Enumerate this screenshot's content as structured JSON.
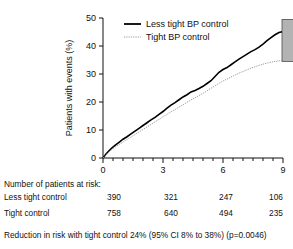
{
  "chart_data": {
    "type": "line",
    "title": "",
    "xlabel": "Years from randomization",
    "ylabel": "Patients with events (%)",
    "xlim": [
      0,
      9
    ],
    "ylim": [
      0,
      50
    ],
    "xticks": [
      0,
      3,
      6,
      9
    ],
    "xtick_labels": [
      "0",
      "3",
      "6",
      "9"
    ],
    "yticks": [
      0,
      10,
      20,
      30,
      40,
      50
    ],
    "ytick_labels": [
      "0",
      "10",
      "20",
      "30",
      "40",
      "50"
    ],
    "minor_xtick_interval": 0.5,
    "grid": false,
    "legend_position": "top-left-inside",
    "annotation_box": {
      "name": "grey-confidence-box",
      "x_start": 8.95,
      "x_end": 9.9,
      "y_low": 34.5,
      "y_high": 49.5,
      "color": "#b3b3b3"
    },
    "series": [
      {
        "name": "Less tight BP control",
        "style": "solid",
        "color": "#000000",
        "x": [
          0,
          0.15,
          0.3,
          0.45,
          0.6,
          0.8,
          1.0,
          1.2,
          1.4,
          1.6,
          1.8,
          2.0,
          2.2,
          2.4,
          2.6,
          2.8,
          3.0,
          3.2,
          3.4,
          3.6,
          3.8,
          4.0,
          4.2,
          4.4,
          4.6,
          4.8,
          5.0,
          5.2,
          5.4,
          5.6,
          5.8,
          6.0,
          6.2,
          6.4,
          6.6,
          6.8,
          7.0,
          7.2,
          7.4,
          7.6,
          7.8,
          8.0,
          8.2,
          8.4,
          8.6,
          8.8,
          8.95
        ],
        "y": [
          0,
          1.4,
          2.6,
          3.6,
          4.5,
          5.6,
          6.7,
          7.6,
          8.6,
          9.6,
          10.6,
          11.6,
          12.6,
          13.6,
          14.5,
          15.6,
          16.6,
          17.8,
          18.9,
          19.8,
          20.8,
          21.8,
          22.6,
          23.6,
          24.1,
          24.8,
          25.6,
          26.6,
          27.6,
          29.1,
          30.6,
          31.6,
          32.3,
          33.3,
          34.3,
          35.3,
          36.2,
          37.1,
          38.0,
          38.7,
          39.6,
          40.7,
          41.9,
          43.0,
          44.0,
          44.8,
          45.1
        ]
      },
      {
        "name": "Tight BP control",
        "style": "dotted",
        "color": "#9a9a9a",
        "x": [
          0,
          0.15,
          0.3,
          0.45,
          0.6,
          0.8,
          1.0,
          1.2,
          1.4,
          1.6,
          1.8,
          2.0,
          2.2,
          2.4,
          2.6,
          2.8,
          3.0,
          3.2,
          3.4,
          3.6,
          3.8,
          4.0,
          4.2,
          4.4,
          4.6,
          4.8,
          5.0,
          5.2,
          5.4,
          5.6,
          5.8,
          6.0,
          6.2,
          6.4,
          6.6,
          6.8,
          7.0,
          7.2,
          7.4,
          7.6,
          7.8,
          8.0,
          8.2,
          8.4,
          8.6,
          8.8,
          8.95
        ],
        "y": [
          0,
          1.2,
          2.2,
          3.1,
          3.9,
          4.8,
          5.7,
          6.6,
          7.5,
          8.4,
          9.3,
          10.2,
          11.1,
          12.0,
          12.9,
          13.8,
          14.7,
          15.6,
          16.5,
          17.3,
          18.2,
          19.0,
          19.9,
          20.7,
          21.5,
          22.3,
          23.1,
          24.0,
          24.9,
          25.8,
          26.7,
          27.5,
          28.2,
          28.9,
          29.6,
          30.3,
          30.9,
          31.5,
          32.1,
          32.6,
          33.1,
          33.5,
          33.9,
          34.2,
          34.5,
          34.7,
          34.8
        ]
      }
    ],
    "legend": [
      {
        "label": "Less tight BP control",
        "style": "solid",
        "color": "#000000"
      },
      {
        "label": "Tight BP control",
        "style": "dotted",
        "color": "#9a9a9a"
      }
    ]
  },
  "risk_table": {
    "title": "Number of patients at risk:",
    "time_points": [
      0,
      3,
      6,
      9
    ],
    "rows": [
      {
        "label": "Less tight control",
        "values": [
          "390",
          "321",
          "247",
          "106"
        ]
      },
      {
        "label": "Tight control",
        "values": [
          "758",
          "640",
          "494",
          "235"
        ]
      }
    ]
  },
  "footnote": {
    "text": "Reduction in risk with tight control 24% (95% CI 8% to 38%) (p=0.0046)"
  }
}
